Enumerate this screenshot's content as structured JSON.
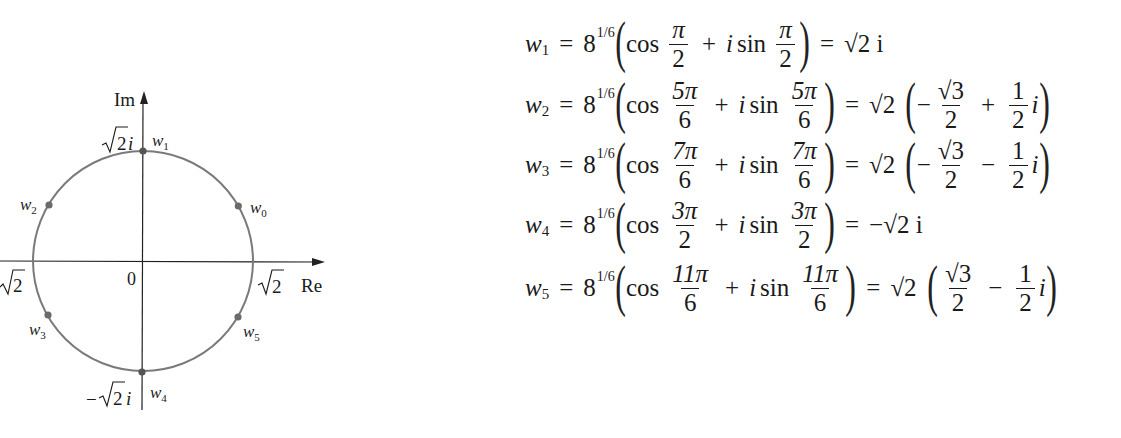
{
  "diagram": {
    "axis_labels": {
      "real": "Re",
      "imaginary": "Im"
    },
    "origin_label": "0",
    "tick_labels": {
      "pos_real": "√2",
      "neg_real": "−√2",
      "pos_imag": "√2i",
      "neg_imag": "−√2i"
    },
    "circle_radius_label": "√2",
    "points": [
      {
        "name": "w",
        "sub": "0",
        "angle_deg": 30
      },
      {
        "name": "w",
        "sub": "1",
        "angle_deg": 90
      },
      {
        "name": "w",
        "sub": "2",
        "angle_deg": 150
      },
      {
        "name": "w",
        "sub": "3",
        "angle_deg": 210
      },
      {
        "name": "w",
        "sub": "4",
        "angle_deg": 270
      },
      {
        "name": "w",
        "sub": "5",
        "angle_deg": 330
      }
    ],
    "colors": {
      "circle": "#7a7a7a",
      "axis": "#222222",
      "point": "#6b6b6b"
    }
  },
  "equations": [
    {
      "lhs_var": "w",
      "lhs_sub": "1",
      "base": "8",
      "exp": "1/6",
      "cos_num": "π",
      "cos_den": "2",
      "sin_num": "π",
      "sin_den": "2",
      "result": "√2 i"
    },
    {
      "lhs_var": "w",
      "lhs_sub": "2",
      "base": "8",
      "exp": "1/6",
      "cos_num": "5π",
      "cos_den": "6",
      "sin_num": "5π",
      "sin_den": "6",
      "result_coeff": "√2",
      "re_sign": "−",
      "re_num": "√3",
      "re_den": "2",
      "im_sign": "+",
      "im_num": "1",
      "im_den": "2",
      "im_unit": "i"
    },
    {
      "lhs_var": "w",
      "lhs_sub": "3",
      "base": "8",
      "exp": "1/6",
      "cos_num": "7π",
      "cos_den": "6",
      "sin_num": "7π",
      "sin_den": "6",
      "result_coeff": "√2",
      "re_sign": "−",
      "re_num": "√3",
      "re_den": "2",
      "im_sign": "−",
      "im_num": "1",
      "im_den": "2",
      "im_unit": "i"
    },
    {
      "lhs_var": "w",
      "lhs_sub": "4",
      "base": "8",
      "exp": "1/6",
      "cos_num": "3π",
      "cos_den": "2",
      "sin_num": "3π",
      "sin_den": "2",
      "result": "−√2 i"
    },
    {
      "lhs_var": "w",
      "lhs_sub": "5",
      "base": "8",
      "exp": "1/6",
      "cos_num": "11π",
      "cos_den": "6",
      "sin_num": "11π",
      "sin_den": "6",
      "result_coeff": "√2",
      "re_sign": "",
      "re_num": "√3",
      "re_den": "2",
      "im_sign": "−",
      "im_num": "1",
      "im_den": "2",
      "im_unit": "i"
    }
  ],
  "symbols": {
    "equals": "=",
    "plus": "+",
    "cos": "cos",
    "sin": "sin",
    "i": "i",
    "lparen": "(",
    "rparen": ")"
  }
}
